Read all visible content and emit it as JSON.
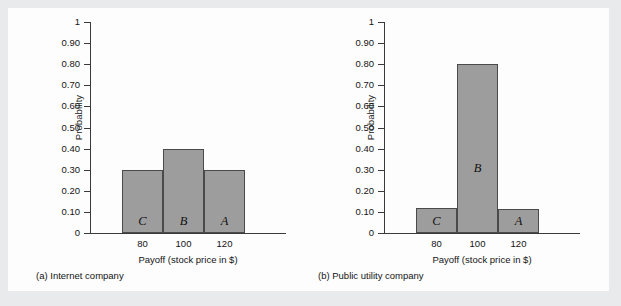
{
  "figure": {
    "background_color": "#fdfdfd",
    "page_color": "#e9eaec",
    "bar_fill_color": "#9d9d9d",
    "bar_edge_color": "#4a4a4a",
    "axis_color": "#3a3a3a"
  },
  "panels": [
    {
      "caption": "(a) Internet company",
      "chart_data": {
        "type": "bar",
        "title": "",
        "xlabel": "Payoff (stock price in $)",
        "ylabel": "Probability",
        "categories": [
          "80",
          "100",
          "120"
        ],
        "values": [
          0.3,
          0.4,
          0.3
        ],
        "bar_labels": [
          "C",
          "B",
          "A"
        ],
        "ylim": [
          0,
          1
        ],
        "yticks": [
          0,
          0.1,
          0.2,
          0.3,
          0.4,
          0.5,
          0.6,
          0.7,
          0.8,
          0.9,
          1
        ],
        "ytick_labels": [
          "0",
          "0.10",
          "0.20",
          "0.30",
          "0.40",
          "0.50",
          "0.60",
          "0.70",
          "0.80",
          "0.90",
          "1"
        ],
        "grid": false,
        "legend": "none",
        "bars_contiguous": true
      }
    },
    {
      "caption": "(b) Public utility company",
      "chart_data": {
        "type": "bar",
        "title": "",
        "xlabel": "Payoff (stock price in $)",
        "ylabel": "Probability",
        "categories": [
          "80",
          "100",
          "120"
        ],
        "values": [
          0.12,
          0.8,
          0.115
        ],
        "bar_labels": [
          "C",
          "B",
          "A"
        ],
        "ylim": [
          0,
          1
        ],
        "yticks": [
          0,
          0.1,
          0.2,
          0.3,
          0.4,
          0.5,
          0.6,
          0.7,
          0.8,
          0.9,
          1
        ],
        "ytick_labels": [
          "0",
          "0.10",
          "0.20",
          "0.30",
          "0.40",
          "0.50",
          "0.60",
          "0.70",
          "0.80",
          "0.90",
          "1"
        ],
        "grid": false,
        "legend": "none",
        "bars_contiguous": true
      }
    }
  ]
}
